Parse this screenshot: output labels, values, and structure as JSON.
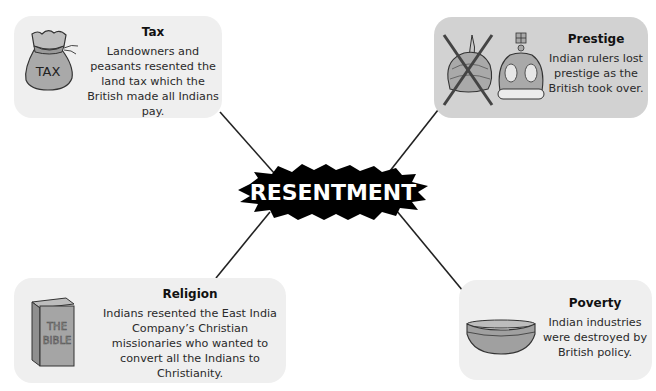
{
  "center": {
    "label": "RESENTMENT"
  },
  "cards": {
    "tax": {
      "title": "Tax",
      "body": "Landowners and peasants resented the land tax which the British made all Indians pay.",
      "icon": "money-bag-icon",
      "icon_text": "TAX"
    },
    "prestige": {
      "title": "Prestige",
      "body": "Indian rulers lost prestige as the British took over.",
      "icons": [
        "crossed-out-turban-icon",
        "crown-icon"
      ]
    },
    "religion": {
      "title": "Religion",
      "body": "Indians resented the East India Company’s Christian missionaries who wanted to convert all the Indians to Christianity.",
      "icon": "bible-icon",
      "icon_text_line1": "THE",
      "icon_text_line2": "BIBLE"
    },
    "poverty": {
      "title": "Poverty",
      "body": "Indian industries were destroyed by British policy.",
      "icon": "bowl-icon"
    }
  },
  "colors": {
    "light_card": "#efefef",
    "dark_card": "#d2d2d2",
    "burst": "#000000",
    "burst_text": "#ffffff",
    "icon_fill": "#a9a9a9"
  }
}
